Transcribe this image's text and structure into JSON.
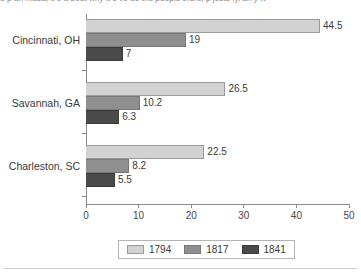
{
  "caption_sliver": "e p an maca, it e a bout why it o ve ue the people there, p jecte ly, an y w",
  "chart_data": {
    "type": "bar",
    "orientation": "horizontal",
    "title": "",
    "xlabel": "",
    "ylabel": "",
    "categories": [
      "Cincinnati, OH",
      "Savannah, GA",
      "Charleston, SC"
    ],
    "series": [
      {
        "name": "1794",
        "color": "#d2d2d2",
        "values": [
          44.5,
          26.5,
          22.5
        ]
      },
      {
        "name": "1817",
        "color": "#8f8f8f",
        "values": [
          19,
          10.2,
          8.2
        ]
      },
      {
        "name": "1841",
        "color": "#4a4a4a",
        "values": [
          7,
          6.3,
          5.5
        ]
      }
    ],
    "xlim": [
      0,
      50
    ],
    "xticks": [
      0,
      10,
      20,
      30,
      40,
      50
    ],
    "xtick_labels": [
      "0",
      "10",
      "20",
      "30",
      "40",
      "50"
    ],
    "data_labels": [
      [
        "44.5",
        "19",
        "7"
      ],
      [
        "26.5",
        "10.2",
        "6.3"
      ],
      [
        "22.5",
        "8.2",
        "5.5"
      ]
    ],
    "grid": false,
    "legend_position": "bottom"
  }
}
